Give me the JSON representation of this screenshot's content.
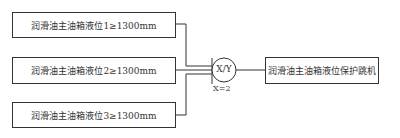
{
  "diagram": {
    "inputs": [
      {
        "label": "润滑油主油箱液位1≥1300mm"
      },
      {
        "label": "润滑油主油箱液位2≥1300mm"
      },
      {
        "label": "润滑油主油箱液位3≥1300mm"
      }
    ],
    "gate": {
      "label": "X/Y",
      "condition": "X=2"
    },
    "output": {
      "label": "润滑油主油箱液位保护跳机"
    },
    "colors": {
      "line": "#333333",
      "background": "#ffffff"
    }
  }
}
